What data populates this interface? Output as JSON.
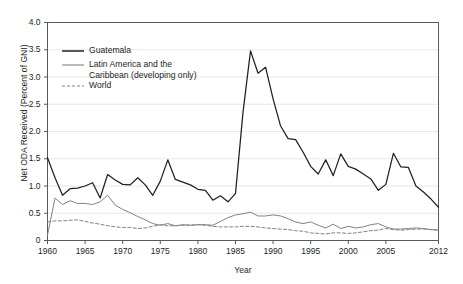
{
  "chart_data": {
    "type": "line",
    "title": "",
    "xlabel": "Year",
    "ylabel": "Net ODA Received (Percent of GNI)",
    "xlim": [
      1960,
      2012
    ],
    "ylim": [
      0,
      4.0
    ],
    "grid": true,
    "legend_position": "top-left",
    "y_ticks": [
      "0",
      "0.5",
      "1.0",
      "1.5",
      "2.0",
      "2.5",
      "3.0",
      "3.5",
      "4.0"
    ],
    "y_tick_values": [
      0,
      0.5,
      1.0,
      1.5,
      2.0,
      2.5,
      3.0,
      3.5,
      4.0
    ],
    "x_ticks": [
      "1960",
      "1965",
      "1970",
      "1975",
      "1980",
      "1985",
      "1990",
      "1995",
      "2000",
      "2005",
      "2012"
    ],
    "x_tick_values": [
      1960,
      1965,
      1970,
      1975,
      1980,
      1985,
      1990,
      1995,
      2000,
      2005,
      2012
    ],
    "x": [
      1960,
      1961,
      1962,
      1963,
      1964,
      1965,
      1966,
      1967,
      1968,
      1969,
      1970,
      1971,
      1972,
      1973,
      1974,
      1975,
      1976,
      1977,
      1978,
      1979,
      1980,
      1981,
      1982,
      1983,
      1984,
      1985,
      1986,
      1987,
      1988,
      1989,
      1990,
      1991,
      1992,
      1993,
      1994,
      1995,
      1996,
      1997,
      1998,
      1999,
      2000,
      2001,
      2002,
      2003,
      2004,
      2005,
      2006,
      2007,
      2008,
      2009,
      2010,
      2011,
      2012
    ],
    "series": [
      {
        "name": "Guatemala",
        "color": "#231f20",
        "style": "solid",
        "values": [
          1.52,
          1.15,
          0.83,
          0.95,
          0.96,
          1.0,
          1.06,
          0.78,
          1.21,
          1.11,
          1.03,
          1.02,
          1.15,
          1.02,
          0.83,
          1.09,
          1.48,
          1.12,
          1.07,
          1.02,
          0.94,
          0.92,
          0.74,
          0.82,
          0.71,
          0.86,
          2.35,
          3.48,
          3.07,
          3.18,
          2.6,
          2.1,
          1.87,
          1.85,
          1.62,
          1.36,
          1.22,
          1.48,
          1.19,
          1.59,
          1.36,
          1.31,
          1.22,
          1.13,
          0.92,
          1.03,
          1.6,
          1.35,
          1.34,
          1.0,
          0.89,
          0.76,
          0.61
        ]
      },
      {
        "name": "Latin America and the Caribbean (developing only)",
        "color": "#808285",
        "style": "solid",
        "values": [
          0.1,
          0.78,
          0.66,
          0.73,
          0.68,
          0.68,
          0.66,
          0.71,
          0.83,
          0.65,
          0.57,
          0.51,
          0.44,
          0.38,
          0.31,
          0.28,
          0.31,
          0.27,
          0.29,
          0.28,
          0.29,
          0.29,
          0.28,
          0.35,
          0.42,
          0.47,
          0.49,
          0.52,
          0.45,
          0.45,
          0.47,
          0.45,
          0.4,
          0.34,
          0.31,
          0.34,
          0.28,
          0.23,
          0.3,
          0.22,
          0.26,
          0.23,
          0.25,
          0.29,
          0.31,
          0.25,
          0.21,
          0.21,
          0.22,
          0.23,
          0.22,
          0.2,
          0.19
        ]
      },
      {
        "name": "World",
        "color": "#808285",
        "style": "dashed",
        "values": [
          0.34,
          0.36,
          0.36,
          0.37,
          0.38,
          0.35,
          0.32,
          0.3,
          0.27,
          0.25,
          0.24,
          0.24,
          0.22,
          0.23,
          0.26,
          0.29,
          0.27,
          0.27,
          0.28,
          0.28,
          0.29,
          0.28,
          0.26,
          0.25,
          0.25,
          0.25,
          0.26,
          0.26,
          0.25,
          0.23,
          0.22,
          0.21,
          0.2,
          0.18,
          0.17,
          0.14,
          0.13,
          0.12,
          0.14,
          0.14,
          0.13,
          0.14,
          0.16,
          0.18,
          0.19,
          0.22,
          0.2,
          0.19,
          0.2,
          0.21,
          0.21,
          0.2,
          0.19
        ]
      }
    ],
    "legend": [
      {
        "label": "Guatemala",
        "color": "#231f20",
        "style": "solid"
      },
      {
        "label": "Latin America and the",
        "label2": "Caribbean (developing only)",
        "color": "#808285",
        "style": "solid"
      },
      {
        "label": "World",
        "color": "#808285",
        "style": "dashed"
      }
    ]
  },
  "colors": {
    "guatemala": "#231f20",
    "region": "#808285",
    "grid": "#e6e7e8",
    "frame": "#58595b",
    "background": "#ffffff"
  }
}
